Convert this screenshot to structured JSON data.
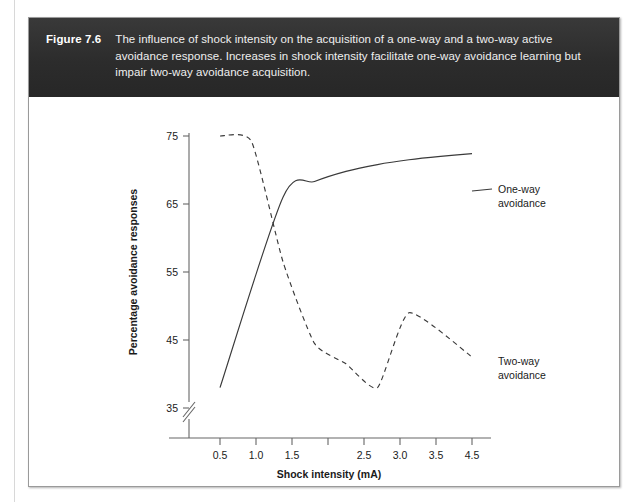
{
  "figure": {
    "number_label": "Figure 7.6",
    "caption": "The influence of shock intensity on the acquisition of a one-way and a two-way active avoidance response. Increases in shock intensity facilitate one-way avoidance learning but impair two-way avoidance acquisition.",
    "band_color": "#2e2e2e",
    "border_color": "#9a9a9a"
  },
  "chart_data": {
    "type": "line",
    "title": "",
    "xlabel": "Shock intensity (mA)",
    "ylabel": "Percentage avoidance responses",
    "xlim": [
      0.0,
      4.75
    ],
    "ylim": [
      33.5,
      76.5
    ],
    "xticks": [
      0.5,
      1.0,
      1.5,
      2.0,
      2.5,
      3.0,
      3.5,
      4.0,
      4.5
    ],
    "xticklabels": [
      "0.5",
      "1.0",
      "1.5",
      "",
      "2.5",
      "3.0",
      "3.5",
      "",
      "4.5"
    ],
    "yticks": [
      35,
      45,
      55,
      65,
      75
    ],
    "yticklabels": [
      "35",
      "45",
      "55",
      "65",
      "75"
    ],
    "grid": false,
    "y_axis_break": true,
    "legend": "inline-annotation",
    "series": [
      {
        "name": "One-way avoidance",
        "label": "One-way\navoidance",
        "label_line1": "One-way",
        "label_line2": "avoidance",
        "style": "solid",
        "color": "#3a3a3a",
        "x": [
          0.5,
          1.5,
          2.0,
          2.5,
          3.0,
          3.5,
          4.0,
          4.5
        ],
        "values": [
          38.0,
          66.0,
          68.3,
          69.8,
          70.8,
          71.5,
          72.0,
          72.4
        ]
      },
      {
        "name": "Two-way avoidance",
        "label": "Two-way\navoidance",
        "label_line1": "Two-way",
        "label_line2": "avoidance",
        "style": "dashed",
        "color": "#3a3a3a",
        "x": [
          0.5,
          1.0,
          1.5,
          2.0,
          2.5,
          3.0,
          3.5,
          4.5
        ],
        "values": [
          75.0,
          74.2,
          56.5,
          44.5,
          41.5,
          38.0,
          49.0,
          42.5
        ]
      }
    ]
  }
}
